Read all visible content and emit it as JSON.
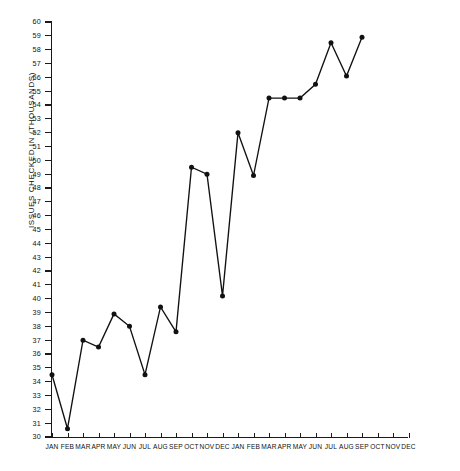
{
  "chart_data": {
    "type": "line",
    "title": "",
    "xlabel": "",
    "ylabel": "ISSUES CHECKED IN  (THOUSANDS)",
    "ylim": [
      30,
      60
    ],
    "ytick_step": 1,
    "grid": false,
    "legend": false,
    "categories": [
      "JAN",
      "FEB",
      "MAR",
      "APR",
      "MAY",
      "JUN",
      "JUL",
      "AUG",
      "SEP",
      "OCT",
      "NOV",
      "DEC",
      "JAN",
      "FEB",
      "MAR",
      "APR",
      "MAY",
      "JUN",
      "JUL",
      "AUG",
      "SEP",
      "OCT",
      "NOV",
      "DEC"
    ],
    "ytick_labels": [
      "60",
      "59",
      "58",
      "57",
      "56",
      "55",
      "54",
      "53",
      "52",
      "51",
      "50",
      "49",
      "48",
      "47",
      "46",
      "45",
      "44",
      "43",
      "42",
      "41",
      "40",
      "39",
      "38",
      "37",
      "36",
      "35",
      "34",
      "33",
      "32",
      "31",
      "30"
    ],
    "values": [
      34.5,
      30.6,
      37.0,
      36.5,
      38.9,
      38.0,
      34.5,
      39.4,
      37.6,
      49.5,
      49.0,
      40.2,
      52.0,
      48.9,
      54.5,
      54.5,
      54.5,
      55.5,
      58.5,
      56.1,
      58.9,
      null,
      null,
      null
    ],
    "series": [
      {
        "name": "Issues checked in",
        "values": [
          34.5,
          30.6,
          37.0,
          36.5,
          38.9,
          38.0,
          34.5,
          39.4,
          37.6,
          49.5,
          49.0,
          40.2,
          52.0,
          48.9,
          54.5,
          54.5,
          54.5,
          55.5,
          58.5,
          56.1,
          58.9,
          null,
          null,
          null
        ]
      }
    ],
    "marker": "filled-circle",
    "line_color": "#111111",
    "marker_color": "#111111"
  }
}
